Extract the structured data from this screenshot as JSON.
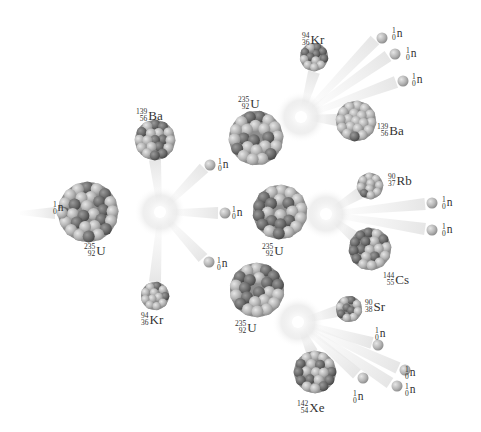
{
  "diagram": {
    "type": "nuclear-fission-chain-reaction",
    "colors": {
      "background": "#ffffff",
      "particle_light": "#b8b8b8",
      "particle_dark": "#6f6f6f",
      "burst": "#f4f4f4",
      "text": "#333333"
    },
    "labels": [
      {
        "id": "n0",
        "mass": "1",
        "atomic": "0",
        "symbol": "n",
        "x": 53,
        "y": 201
      },
      {
        "id": "u0",
        "mass": "235",
        "atomic": "92",
        "symbol": "U",
        "x": 84,
        "y": 243
      },
      {
        "id": "ba1",
        "mass": "139",
        "atomic": "56",
        "symbol": "Ba",
        "x": 136,
        "y": 108
      },
      {
        "id": "kr1",
        "mass": "94",
        "atomic": "36",
        "symbol": "Kr",
        "x": 141,
        "y": 312
      },
      {
        "id": "n1a",
        "mass": "1",
        "atomic": "0",
        "symbol": "n",
        "x": 218,
        "y": 158
      },
      {
        "id": "n1b",
        "mass": "1",
        "atomic": "0",
        "symbol": "n",
        "x": 232,
        "y": 206
      },
      {
        "id": "n1c",
        "mass": "1",
        "atomic": "0",
        "symbol": "n",
        "x": 217,
        "y": 257
      },
      {
        "id": "u1",
        "mass": "235",
        "atomic": "92",
        "symbol": "U",
        "x": 238,
        "y": 96
      },
      {
        "id": "u2",
        "mass": "235",
        "atomic": "92",
        "symbol": "U",
        "x": 262,
        "y": 243
      },
      {
        "id": "u3",
        "mass": "235",
        "atomic": "92",
        "symbol": "U",
        "x": 235,
        "y": 320
      },
      {
        "id": "kr2",
        "mass": "94",
        "atomic": "36",
        "symbol": "Kr",
        "x": 302,
        "y": 32
      },
      {
        "id": "n2a",
        "mass": "1",
        "atomic": "0",
        "symbol": "n",
        "x": 392,
        "y": 27
      },
      {
        "id": "n2b",
        "mass": "1",
        "atomic": "0",
        "symbol": "n",
        "x": 406,
        "y": 47
      },
      {
        "id": "n2c",
        "mass": "1",
        "atomic": "0",
        "symbol": "n",
        "x": 412,
        "y": 73
      },
      {
        "id": "ba2",
        "mass": "139",
        "atomic": "56",
        "symbol": "Ba",
        "x": 377,
        "y": 123
      },
      {
        "id": "rb",
        "mass": "90",
        "atomic": "37",
        "symbol": "Rb",
        "x": 388,
        "y": 173
      },
      {
        "id": "n3a",
        "mass": "1",
        "atomic": "0",
        "symbol": "n",
        "x": 442,
        "y": 196
      },
      {
        "id": "n3b",
        "mass": "1",
        "atomic": "0",
        "symbol": "n",
        "x": 442,
        "y": 223
      },
      {
        "id": "cs",
        "mass": "144",
        "atomic": "55",
        "symbol": "Cs",
        "x": 383,
        "y": 272
      },
      {
        "id": "sr",
        "mass": "90",
        "atomic": "38",
        "symbol": "Sr",
        "x": 365,
        "y": 299
      },
      {
        "id": "n4a",
        "mass": "1",
        "atomic": "0",
        "symbol": "n",
        "x": 375,
        "y": 327
      },
      {
        "id": "n4b",
        "mass": "1",
        "atomic": "0",
        "symbol": "n",
        "x": 353,
        "y": 390
      },
      {
        "id": "n4c",
        "mass": "1",
        "atomic": "0",
        "symbol": "n",
        "x": 405,
        "y": 366
      },
      {
        "id": "n4d",
        "mass": "1",
        "atomic": "0",
        "symbol": "n",
        "x": 405,
        "y": 383
      },
      {
        "id": "xe",
        "mass": "142",
        "atomic": "54",
        "symbol": "Xe",
        "x": 297,
        "y": 400
      }
    ],
    "nuclei": [
      {
        "id": "u0",
        "cx": 88,
        "cy": 212,
        "r": 30
      },
      {
        "id": "ba1",
        "cx": 155,
        "cy": 140,
        "r": 20
      },
      {
        "id": "kr1",
        "cx": 155,
        "cy": 296,
        "r": 14
      },
      {
        "id": "u1",
        "cx": 256,
        "cy": 138,
        "r": 27
      },
      {
        "id": "u2",
        "cx": 280,
        "cy": 212,
        "r": 27
      },
      {
        "id": "u3",
        "cx": 257,
        "cy": 290,
        "r": 27
      },
      {
        "id": "kr2",
        "cx": 314,
        "cy": 57,
        "r": 14
      },
      {
        "id": "ba2",
        "cx": 356,
        "cy": 121,
        "r": 20
      },
      {
        "id": "rb",
        "cx": 370,
        "cy": 186,
        "r": 13
      },
      {
        "id": "cs",
        "cx": 370,
        "cy": 249,
        "r": 21
      },
      {
        "id": "sr",
        "cx": 349,
        "cy": 309,
        "r": 13
      },
      {
        "id": "xe",
        "cx": 315,
        "cy": 372,
        "r": 21
      }
    ],
    "neutrons": [
      {
        "cx": 62,
        "cy": 213
      },
      {
        "cx": 210,
        "cy": 165
      },
      {
        "cx": 225,
        "cy": 213
      },
      {
        "cx": 209,
        "cy": 262
      },
      {
        "cx": 382,
        "cy": 38
      },
      {
        "cx": 395,
        "cy": 54
      },
      {
        "cx": 403,
        "cy": 81
      },
      {
        "cx": 432,
        "cy": 203
      },
      {
        "cx": 432,
        "cy": 230
      },
      {
        "cx": 378,
        "cy": 345
      },
      {
        "cx": 363,
        "cy": 378
      },
      {
        "cx": 405,
        "cy": 370
      },
      {
        "cx": 397,
        "cy": 386
      }
    ],
    "bursts": [
      {
        "cx": 160,
        "cy": 212
      },
      {
        "cx": 301,
        "cy": 117
      },
      {
        "cx": 326,
        "cy": 214
      },
      {
        "cx": 298,
        "cy": 322
      }
    ],
    "trails": [
      [
        20,
        213,
        55,
        213
      ],
      [
        160,
        212,
        155,
        160
      ],
      [
        160,
        212,
        155,
        282
      ],
      [
        160,
        212,
        204,
        168
      ],
      [
        160,
        212,
        218,
        213
      ],
      [
        160,
        212,
        203,
        258
      ],
      [
        301,
        117,
        314,
        72
      ],
      [
        301,
        117,
        337,
        120
      ],
      [
        301,
        117,
        375,
        40
      ],
      [
        301,
        117,
        388,
        56
      ],
      [
        301,
        117,
        396,
        82
      ],
      [
        326,
        214,
        360,
        193
      ],
      [
        326,
        214,
        356,
        238
      ],
      [
        326,
        214,
        425,
        204
      ],
      [
        326,
        214,
        425,
        229
      ],
      [
        298,
        322,
        338,
        311
      ],
      [
        298,
        322,
        312,
        352
      ],
      [
        298,
        322,
        372,
        343
      ],
      [
        298,
        322,
        357,
        374
      ],
      [
        298,
        322,
        398,
        368
      ],
      [
        298,
        322,
        390,
        383
      ]
    ]
  }
}
